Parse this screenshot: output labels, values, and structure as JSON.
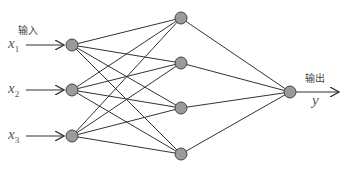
{
  "diagram": {
    "input_label": "输入",
    "output_label": "输出",
    "inputs": [
      {
        "name": "x",
        "sub": "1"
      },
      {
        "name": "x",
        "sub": "2"
      },
      {
        "name": "x",
        "sub": "3"
      }
    ],
    "output_var": "y",
    "layers": {
      "input": [
        [
          72,
          45
        ],
        [
          72,
          90
        ],
        [
          72,
          136
        ]
      ],
      "hidden": [
        [
          181,
          18
        ],
        [
          181,
          63
        ],
        [
          181,
          108
        ],
        [
          181,
          154
        ]
      ],
      "output": [
        [
          290,
          92
        ]
      ]
    },
    "node_radius": 6,
    "colors": {
      "node_fill": "#9a9a9a",
      "node_stroke": "#444444",
      "edge": "#333333"
    }
  }
}
